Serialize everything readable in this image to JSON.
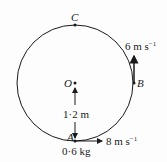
{
  "diagram": {
    "type": "vertical-circle-motion",
    "points": {
      "C": {
        "label": "C",
        "position": "top"
      },
      "O": {
        "label": "O",
        "position": "centre"
      },
      "B": {
        "label": "B",
        "position": "right"
      },
      "A": {
        "label": "A",
        "position": "bottom"
      }
    },
    "radius_label": "1·2 m",
    "mass_label": "0·6 kg",
    "velocity_A": {
      "value": "8",
      "unit": "m s",
      "exp": "−1",
      "direction": "right"
    },
    "velocity_B": {
      "value": "6",
      "unit": "m s",
      "exp": "−1",
      "direction": "up"
    },
    "colors": {
      "stroke": "#1a1a1a",
      "background": "#fdfdfd"
    }
  }
}
